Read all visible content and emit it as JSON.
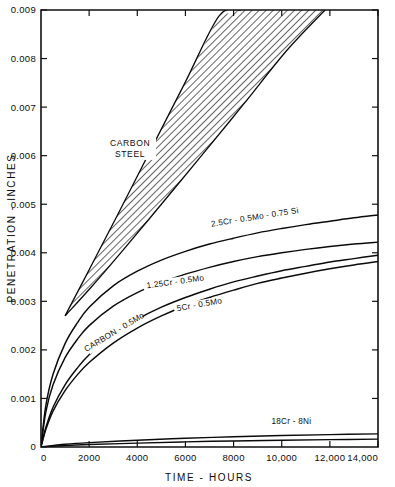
{
  "chart_data": {
    "type": "line",
    "title": "",
    "xlabel": "TIME - HOURS",
    "ylabel": "PENETRATION - INCHES",
    "xlim": [
      0,
      14000
    ],
    "ylim": [
      0,
      0.009
    ],
    "grid": false,
    "legend": "inline-curve-labels",
    "xticks": [
      0,
      2000,
      4000,
      6000,
      8000,
      10000,
      12000,
      14000
    ],
    "xtick_labels": [
      "0",
      "2000",
      "4000",
      "6000",
      "8000",
      "10,000",
      "12,000",
      "14,000"
    ],
    "yticks": [
      0,
      0.001,
      0.002,
      0.003,
      0.004,
      0.005,
      0.006,
      0.007,
      0.008,
      0.009
    ],
    "ytick_labels": [
      "0",
      "0.001",
      "0.002",
      "0.003",
      "0.004",
      "0.005",
      "0.006",
      "0.007",
      "0.008",
      "0.009"
    ],
    "annotations": [
      {
        "text": "CARBON STEEL",
        "x": 3700,
        "y": 0.0062,
        "kind": "band-region-label"
      }
    ],
    "bands": [
      {
        "name": "CARBON STEEL",
        "label_line1": "CARBON",
        "label_line2": "STEEL",
        "fill": "diagonal-hatch",
        "upper_bound": {
          "x": [
            1000,
            2000,
            3200,
            4600,
            6000,
            7400,
            8300
          ],
          "y": [
            0.0027,
            0.00365,
            0.0048,
            0.00616,
            0.00752,
            0.00888,
            0.009
          ]
        },
        "lower_bound": {
          "x": [
            1000,
            2100,
            3400,
            5000,
            6600,
            8400,
            10200,
            11800
          ],
          "y": [
            0.0027,
            0.0033,
            0.00405,
            0.005,
            0.00596,
            0.00705,
            0.00816,
            0.009
          ]
        }
      }
    ],
    "series": [
      {
        "name": "2.5Cr - 0.5Mo - 0.75 Si",
        "label": "2.5Cr - 0.5Mo - 0.75 Si",
        "label_x": 8900,
        "label_y": 0.00468,
        "label_rotation": -9,
        "x": [
          0,
          200,
          500,
          1000,
          1500,
          2000,
          3000,
          4000,
          5000,
          6000,
          7000,
          8000,
          9000,
          10000,
          11000,
          12000,
          13000,
          14000
        ],
        "y": [
          0,
          0.00085,
          0.0015,
          0.00213,
          0.00255,
          0.00288,
          0.00332,
          0.00362,
          0.00385,
          0.00403,
          0.00418,
          0.0043,
          0.00441,
          0.0045,
          0.00458,
          0.00465,
          0.00472,
          0.00478
        ]
      },
      {
        "name": "1.25Cr - 0.5Mo",
        "label": "1.25Cr - 0.5Mo",
        "label_x": 5600,
        "label_y": 0.00335,
        "label_rotation": -8,
        "x": [
          0,
          200,
          500,
          1000,
          1500,
          2000,
          3000,
          4000,
          5000,
          6000,
          7000,
          8000,
          9000,
          10000,
          11000,
          12000,
          13000,
          14000
        ],
        "y": [
          0,
          0.00072,
          0.00128,
          0.00184,
          0.00221,
          0.0025,
          0.0029,
          0.00318,
          0.00339,
          0.00356,
          0.0037,
          0.00382,
          0.00392,
          0.004,
          0.00407,
          0.00413,
          0.00418,
          0.00422
        ]
      },
      {
        "name": "5Cr - 0.5Mo",
        "label": "5Cr - 0.5Mo",
        "label_x": 6600,
        "label_y": 0.00288,
        "label_rotation": -10,
        "x": [
          0,
          200,
          500,
          1000,
          1500,
          2000,
          3000,
          4000,
          5000,
          6000,
          7000,
          8000,
          9000,
          10000,
          11000,
          12000,
          13000,
          14000
        ],
        "y": [
          0,
          0.0004,
          0.00082,
          0.00128,
          0.00162,
          0.0019,
          0.00232,
          0.00263,
          0.00288,
          0.00308,
          0.00325,
          0.0034,
          0.00352,
          0.00363,
          0.00372,
          0.00381,
          0.00388,
          0.00395
        ]
      },
      {
        "name": "CARBON - 0.5Mo",
        "label": "CARBON - 0.5Mo",
        "label_x": 3100,
        "label_y": 0.00232,
        "label_rotation": -31,
        "x": [
          0,
          200,
          500,
          1000,
          1500,
          2000,
          3000,
          4000,
          5000,
          6000,
          7000,
          8000,
          9000,
          10000,
          11000,
          12000,
          13000,
          14000
        ],
        "y": [
          0,
          0.00036,
          0.00074,
          0.00116,
          0.00148,
          0.00174,
          0.00214,
          0.00245,
          0.0027,
          0.00291,
          0.00308,
          0.00323,
          0.00337,
          0.00348,
          0.00358,
          0.00367,
          0.00375,
          0.00382
        ]
      },
      {
        "name": "18Cr - 8Ni",
        "label": "18Cr - 8Ni",
        "label_x": 10400,
        "label_y": 0.00048,
        "label_rotation": 0,
        "x": [
          0,
          1000,
          2000,
          4000,
          6000,
          8000,
          10000,
          12000,
          14000
        ],
        "y": [
          0,
          5.5e-05,
          9e-05,
          0.00014,
          0.00018,
          0.00021,
          0.000235,
          0.000255,
          0.00027
        ]
      },
      {
        "name": "18Cr - 8Ni lower",
        "label": "",
        "label_x": 0,
        "label_y": 0,
        "label_rotation": 0,
        "x": [
          0,
          1000,
          2000,
          4000,
          6000,
          8000,
          10000,
          12000,
          14000
        ],
        "y": [
          0,
          3e-05,
          5e-05,
          8e-05,
          0.000105,
          0.000125,
          0.00014,
          0.000152,
          0.000162
        ]
      }
    ],
    "colors": {
      "axis": "#111111",
      "curve": "#0a0a0a",
      "hatch": "#3a3a3a",
      "background": "#ffffff"
    }
  }
}
